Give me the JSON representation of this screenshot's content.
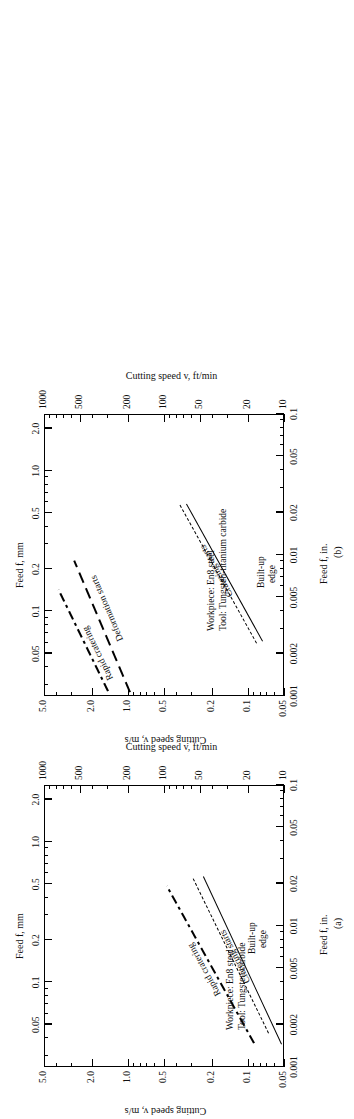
{
  "figure": {
    "orientation": "rotated-90-ccw",
    "panel_count": 2
  },
  "chart_data": [
    {
      "type": "line",
      "panel": "(a)",
      "title": "",
      "xlabel_primary": "Feed f, mm",
      "xlabel_secondary": "Feed f, in.",
      "ylabel_primary": "Cutting speed v, m/s",
      "ylabel_secondary": "Cutting speed v, ft/min",
      "xscale": "log",
      "yscale": "log",
      "xlim_mm": [
        0.025,
        2.54
      ],
      "xlim_in": [
        0.001,
        0.1
      ],
      "ylim_ms": [
        0.05,
        5.0
      ],
      "ylim_ftmin": [
        10,
        1000
      ],
      "xticks_mm": [
        "0.05",
        "0.1",
        "0.2",
        "0.5",
        "1.0",
        "2.0"
      ],
      "xticks_in": [
        "0.001",
        "0.002",
        "0.005",
        "0.01",
        "0.02",
        "0.05",
        "0.1"
      ],
      "yticks_ms": [
        "5.0",
        "2.0",
        "1.0",
        "0.5",
        "0.2",
        "0.1",
        "0.05"
      ],
      "yticks_ftmin": [
        "1000",
        "500",
        "200",
        "100",
        "50",
        "20",
        "10"
      ],
      "grid": false,
      "legend": "inline-annotations",
      "notes": [
        "Workpiece: En8 steel",
        "Tool: Tungsten carbide"
      ],
      "series": [
        {
          "name": "Rapid cratering",
          "style": "dash-dot",
          "points_feed_mm": [
            0.062,
            0.8
          ],
          "points_speed_ms": [
            2.7,
            0.62
          ]
        },
        {
          "name": "Cratering starts",
          "style": "dashed",
          "points_feed_mm": [
            0.078,
            0.78
          ],
          "points_speed_ms": [
            1.45,
            0.4
          ]
        },
        {
          "name": "Built-up edge",
          "style": "solid",
          "points_feed_mm": [
            0.06,
            0.8
          ],
          "points_speed_ms": [
            0.96,
            0.35
          ]
        }
      ]
    },
    {
      "type": "line",
      "panel": "(b)",
      "title": "",
      "xlabel_primary": "Feed f, mm",
      "xlabel_secondary": "Feed f, in.",
      "ylabel_primary": "Cutting speed v, m/s",
      "ylabel_secondary": "Cutting speed v, ft/min",
      "xscale": "log",
      "yscale": "log",
      "xlim_mm": [
        0.025,
        2.54
      ],
      "xlim_in": [
        0.001,
        0.1
      ],
      "ylim_ms": [
        0.05,
        5.0
      ],
      "ylim_ftmin": [
        10,
        1000
      ],
      "xticks_mm": [
        "0.05",
        "0.1",
        "0.2",
        "0.5",
        "1.0",
        "2.0"
      ],
      "xticks_in": [
        "0.001",
        "0.002",
        "0.005",
        "0.01",
        "0.02",
        "0.05",
        "0.1"
      ],
      "yticks_ms": [
        "5.0",
        "2.0",
        "1.0",
        "0.5",
        "0.2",
        "0.1",
        "0.05"
      ],
      "yticks_ftmin": [
        "1000",
        "500",
        "200",
        "100",
        "50",
        "20",
        "10"
      ],
      "grid": false,
      "legend": "inline-annotations",
      "notes": [
        "Workpiece: En8 steel",
        "Tool: Tungsten-titanium carbide"
      ],
      "series": [
        {
          "name": "Rapid cratering",
          "style": "dash-dot",
          "points_feed_mm": [
            0.21,
            0.95
          ],
          "points_speed_ms": [
            4.9,
            1.85
          ]
        },
        {
          "name": "Deformation starts",
          "style": "long-dash",
          "points_feed_mm": [
            0.185,
            1.05
          ],
          "points_speed_ms": [
            4.9,
            1.25
          ]
        },
        {
          "name": "Cratering starts",
          "style": "dashed",
          "points_feed_mm": [
            0.055,
            0.8
          ],
          "points_speed_ms": [
            0.44,
            0.16
          ]
        },
        {
          "name": "Built-up edge",
          "style": "solid",
          "points_feed_mm": [
            0.053,
            0.8
          ],
          "points_speed_ms": [
            0.4,
            0.155
          ]
        }
      ]
    }
  ],
  "panel_a": {
    "label": "(a)",
    "axis_feed_mm": "Feed f, mm",
    "axis_feed_in": "Feed f, in.",
    "axis_speed_ms": "Cutting speed v, m/s",
    "axis_speed_ftmin": "Cutting speed v, ft/min",
    "feed_mm_ticks": [
      "0.05",
      "0.1",
      "0.2",
      "0.5",
      "1.0",
      "2.0"
    ],
    "feed_in_ticks": [
      "0.001",
      "0.002",
      "0.005",
      "0.01",
      "0.02",
      "0.05",
      "0.1"
    ],
    "speed_ms_ticks": [
      "5.0",
      "2.0",
      "1.0",
      "0.5",
      "0.2",
      "0.1",
      "0.05"
    ],
    "speed_ftmin_ticks": [
      "1000",
      "500",
      "200",
      "100",
      "50",
      "20",
      "10"
    ],
    "curve_labels": [
      "Rapid cratering",
      "Cratering starts",
      "Built-up",
      "edge"
    ],
    "note_workpiece": "Workpiece: En8 steel",
    "note_tool": "Tool: Tungsten carbide"
  },
  "panel_b": {
    "label": "(b)",
    "axis_feed_mm": "Feed f, mm",
    "axis_feed_in": "Feed f, in.",
    "axis_speed_ms": "Cutting speed v, m/s",
    "axis_speed_ftmin": "Cutting speed v, ft/min",
    "feed_mm_ticks": [
      "0.05",
      "0.1",
      "0.2",
      "0.5",
      "1.0",
      "2.0"
    ],
    "feed_in_ticks": [
      "0.001",
      "0.002",
      "0.005",
      "0.01",
      "0.02",
      "0.05",
      "0.1"
    ],
    "speed_ms_ticks": [
      "5.0",
      "2.0",
      "1.0",
      "0.5",
      "0.2",
      "0.1",
      "0.05"
    ],
    "speed_ftmin_ticks": [
      "1000",
      "500",
      "200",
      "100",
      "50",
      "20",
      "10"
    ],
    "curve_labels": [
      "Rapid cratering",
      "Deformation starts",
      "Cratering starts",
      "Built-up",
      "edge"
    ],
    "note_workpiece": "Workpiece: En8 steel",
    "note_tool": "Tool: Tungsten-titanium carbide"
  },
  "colors": {
    "ink": "#000000",
    "paper": "#ffffff"
  }
}
